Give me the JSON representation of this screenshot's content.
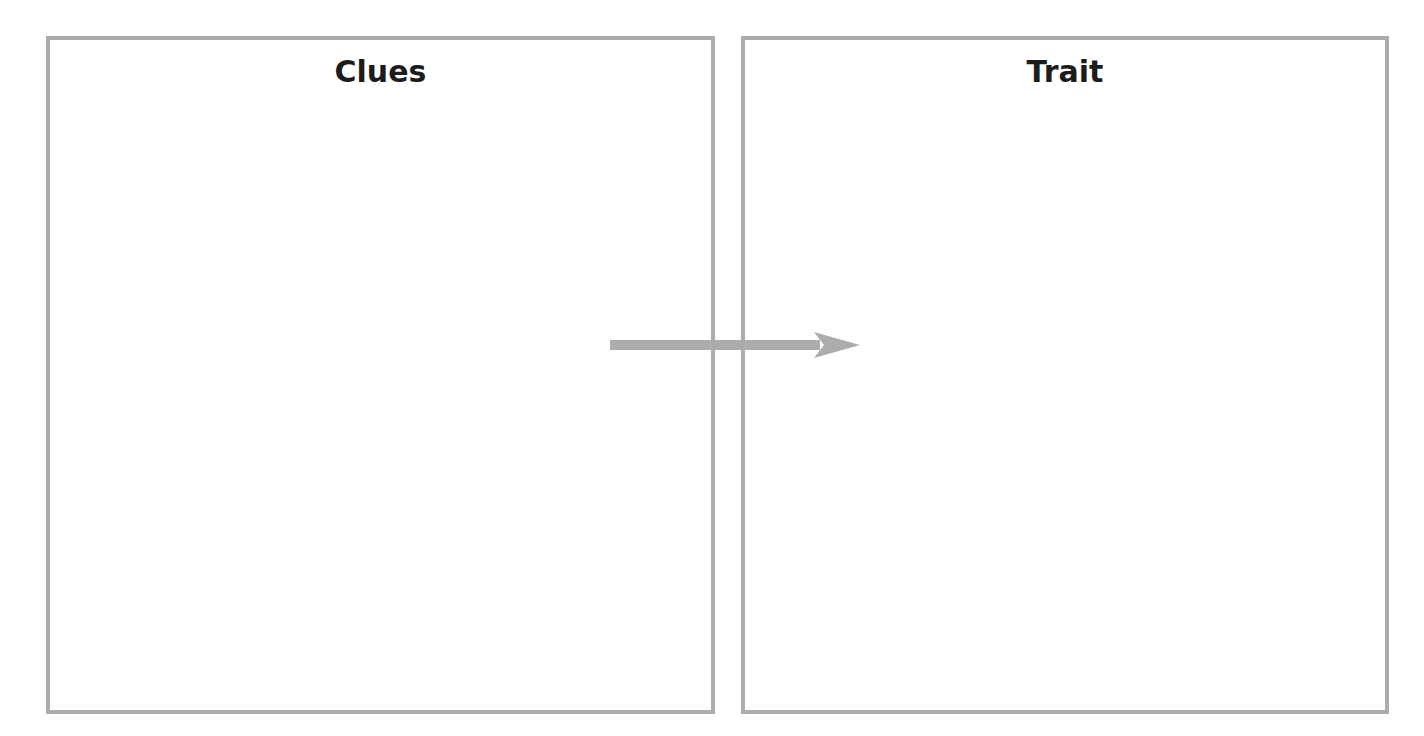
{
  "diagram": {
    "left_box": {
      "title": "Clues"
    },
    "right_box": {
      "title": "Trait"
    },
    "arrow": {
      "direction": "right",
      "from": "Clues",
      "to": "Trait",
      "color": "#acacac"
    },
    "border_color": "#acacac"
  }
}
